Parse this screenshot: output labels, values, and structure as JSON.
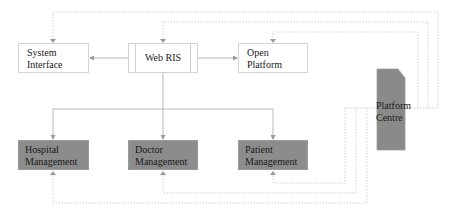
{
  "diagram": {
    "nodes": {
      "system_interface": {
        "label": "System\nInterface"
      },
      "web_ris": {
        "label": "Web RIS"
      },
      "open_platform": {
        "label": "Open\nPlatform"
      },
      "platform_centre": {
        "label": "Platform\nCentre"
      },
      "hospital_management": {
        "label": "Hospital\nManagement"
      },
      "doctor_management": {
        "label": "Doctor\nManagement"
      },
      "patient_management": {
        "label": "Patient\nManagement"
      }
    },
    "edges": [
      {
        "from": "Web RIS",
        "to": "System Interface",
        "style": "solid"
      },
      {
        "from": "Web RIS",
        "to": "Open Platform",
        "style": "solid"
      },
      {
        "from": "Web RIS",
        "to": "Hospital Management",
        "style": "solid"
      },
      {
        "from": "Web RIS",
        "to": "Doctor Management",
        "style": "solid"
      },
      {
        "from": "Web RIS",
        "to": "Patient Management",
        "style": "solid"
      },
      {
        "from": "Platform Centre",
        "to": "System Interface",
        "style": "dotted"
      },
      {
        "from": "Platform Centre",
        "to": "Web RIS",
        "style": "dotted"
      },
      {
        "from": "Platform Centre",
        "to": "Open Platform",
        "style": "dotted"
      },
      {
        "from": "Platform Centre",
        "to": "Hospital Management",
        "style": "dotted"
      },
      {
        "from": "Platform Centre",
        "to": "Doctor Management",
        "style": "dotted"
      },
      {
        "from": "Platform Centre",
        "to": "Patient Management",
        "style": "dotted"
      }
    ],
    "colors": {
      "box_fill_light": "#ffffff",
      "box_fill_dark": "#8c8c8c",
      "line_solid": "#b8b8b8",
      "line_dotted": "#cfcfcf"
    }
  }
}
